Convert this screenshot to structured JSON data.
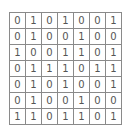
{
  "grid": {
    "rows": [
      [
        "0",
        "1",
        "0",
        "1",
        "0",
        "0",
        "1"
      ],
      [
        "0",
        "1",
        "0",
        "0",
        "1",
        "0",
        "0"
      ],
      [
        "1",
        "0",
        "0",
        "1",
        "1",
        "0",
        "1"
      ],
      [
        "0",
        "1",
        "1",
        "1",
        "0",
        "1",
        "1"
      ],
      [
        "0",
        "1",
        "0",
        "1",
        "0",
        "0",
        "1"
      ],
      [
        "0",
        "1",
        "0",
        "0",
        "1",
        "0",
        "0"
      ],
      [
        "1",
        "1",
        "0",
        "1",
        "1",
        "0",
        "1"
      ]
    ]
  }
}
